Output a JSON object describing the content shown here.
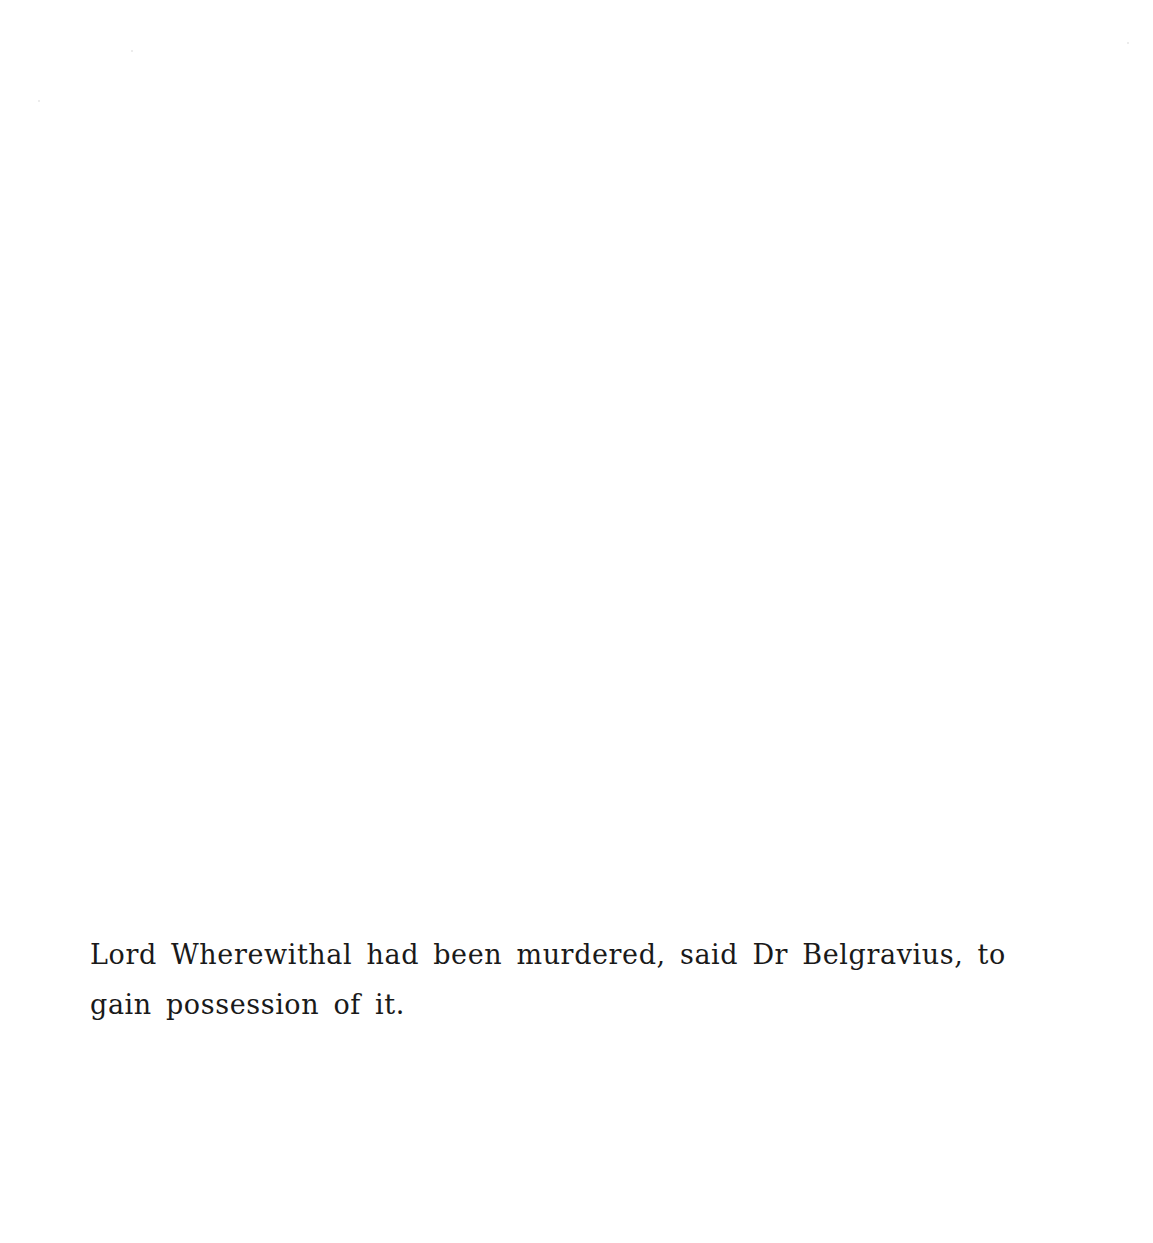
{
  "page": {
    "background": "#ffffff",
    "text_color": "#1a1a1a"
  },
  "caption": {
    "lines": [
      "Lord Wherewithal had been murdered, said Dr Belgravius, to",
      "gain possession of it."
    ],
    "full_text": "Lord Wherewithal had been murdered, said Dr Belgravius, to gain possession of it."
  }
}
